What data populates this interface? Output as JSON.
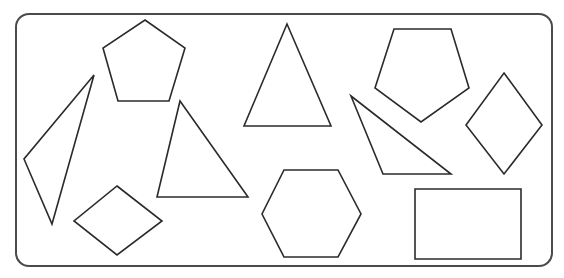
{
  "figure": {
    "stroke_color": "#2b2b2b",
    "frame_color": "#4a4a4a",
    "background": "#ffffff",
    "frame": {
      "x": 16,
      "y": 14,
      "width": 536,
      "height": 252,
      "radius": 13
    },
    "shapes": [
      {
        "id": "left-scalene-triangle",
        "type": "triangle",
        "points": "94,75 24,159 52,224"
      },
      {
        "id": "top-left-pentagon",
        "type": "pentagon",
        "points": "145,20 185,48 169,101 118,101 103,48"
      },
      {
        "id": "bottom-left-rhombus",
        "type": "rhombus",
        "points": "117,186 162,221 117,255 74,221"
      },
      {
        "id": "middle-triangle",
        "type": "triangle",
        "points": "180,101 248,197 157,197"
      },
      {
        "id": "tall-isosceles-triangle",
        "type": "triangle",
        "points": "287,24 331,126 244,126"
      },
      {
        "id": "hexagon",
        "type": "hexagon",
        "points": "284,170 338,170 361,214 338,257 284,257 262,214"
      },
      {
        "id": "inverted-pentagon",
        "type": "pentagon",
        "points": "394,29 451,29 469,88 421,122 375,88"
      },
      {
        "id": "right-obtuse-triangle",
        "type": "triangle",
        "points": "351,96 451,174 383,174"
      },
      {
        "id": "right-rhombus",
        "type": "rhombus",
        "points": "504,73 542,125 504,174 466,125"
      },
      {
        "id": "rectangle",
        "type": "rectangle",
        "points": "415,189 521,189 521,259 415,259"
      }
    ]
  }
}
